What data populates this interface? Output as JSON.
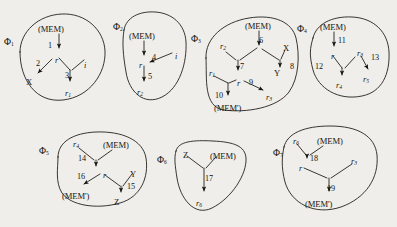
{
  "figure": {
    "background_color": "#efeeea",
    "ink_color": "#16150f"
  },
  "labels": {
    "mem": "(MEM)",
    "mem_prime": "(MEM')",
    "r": "r",
    "i": "i",
    "x": "X",
    "y": "Y",
    "z": "Z"
  },
  "fragments": [
    {
      "id": "phi1",
      "name": "Φ",
      "index": "1",
      "nodes": [
        {
          "key": "mem",
          "text": "(MEM)"
        },
        {
          "key": "r",
          "text": "r"
        },
        {
          "key": "i",
          "text": "i"
        },
        {
          "key": "x",
          "text": "X"
        },
        {
          "key": "r1",
          "text": "r",
          "sub": "1"
        }
      ],
      "edges": [
        {
          "label": "1",
          "from": "mem",
          "to": "r"
        },
        {
          "label": "2",
          "from": "r",
          "to": "x"
        },
        {
          "label": "3",
          "from": "r,i",
          "to": "r1"
        }
      ]
    },
    {
      "id": "phi2",
      "name": "Φ",
      "index": "2",
      "nodes": [
        {
          "key": "mem",
          "text": "(MEM)"
        },
        {
          "key": "r",
          "text": "r"
        },
        {
          "key": "i",
          "text": "i"
        },
        {
          "key": "r2",
          "text": "r",
          "sub": "2"
        }
      ],
      "edges": [
        {
          "label": "4",
          "from": "i",
          "to": "r"
        },
        {
          "label": "5",
          "from": "r",
          "to": "r2"
        }
      ]
    },
    {
      "id": "phi3",
      "name": "Φ",
      "index": "3",
      "nodes": [
        {
          "key": "mem",
          "text": "(MEM)"
        },
        {
          "key": "r2",
          "text": "r",
          "sub": "2"
        },
        {
          "key": "x",
          "text": "X"
        },
        {
          "key": "y",
          "text": "Y"
        },
        {
          "key": "r1",
          "text": "r",
          "sub": "1"
        },
        {
          "key": "r",
          "text": "r"
        },
        {
          "key": "r3",
          "text": "r",
          "sub": "3"
        },
        {
          "key": "memp",
          "text": "(MEM')"
        }
      ],
      "edges": [
        {
          "label": "6",
          "from": "mem",
          "to": "r"
        },
        {
          "label": "7",
          "from": "r2,mem",
          "to": "r"
        },
        {
          "label": "8",
          "from": "x",
          "to": "y"
        },
        {
          "label": "9",
          "from": "r",
          "to": "r3"
        },
        {
          "label": "10",
          "from": "r1,r",
          "to": "memp"
        }
      ]
    },
    {
      "id": "phi4",
      "name": "Φ",
      "index": "4",
      "nodes": [
        {
          "key": "mem",
          "text": "(MEM)"
        },
        {
          "key": "r",
          "text": "r"
        },
        {
          "key": "r3",
          "text": "r",
          "sub": "3"
        },
        {
          "key": "r4",
          "text": "r",
          "sub": "4"
        },
        {
          "key": "r5",
          "text": "r",
          "sub": "5"
        }
      ],
      "edges": [
        {
          "label": "11",
          "from": "mem",
          "to": "r"
        },
        {
          "label": "12",
          "from": "r",
          "to": "r4"
        },
        {
          "label": "13",
          "from": "r3",
          "to": "r5"
        }
      ]
    },
    {
      "id": "phi5",
      "name": "Φ",
      "index": "5",
      "nodes": [
        {
          "key": "r4",
          "text": "r",
          "sub": "4"
        },
        {
          "key": "mem",
          "text": "(MEM)"
        },
        {
          "key": "r",
          "text": "r"
        },
        {
          "key": "y",
          "text": "Y"
        },
        {
          "key": "memp",
          "text": "(MEM')"
        },
        {
          "key": "z",
          "text": "Z"
        }
      ],
      "edges": [
        {
          "label": "14",
          "from": "r4,mem",
          "to": "r"
        },
        {
          "label": "16",
          "from": "r",
          "to": "memp"
        },
        {
          "label": "15",
          "from": "r,y",
          "to": "z"
        }
      ]
    },
    {
      "id": "phi6",
      "name": "Φ",
      "index": "6",
      "nodes": [
        {
          "key": "z",
          "text": "Z"
        },
        {
          "key": "mem",
          "text": "(MEM)"
        },
        {
          "key": "r6",
          "text": "r",
          "sub": "6"
        }
      ],
      "edges": [
        {
          "label": "17",
          "from": "z,mem",
          "to": "r6"
        }
      ]
    },
    {
      "id": "phi7",
      "name": "Φ",
      "index": "7",
      "nodes": [
        {
          "key": "r6",
          "text": "r",
          "sub": "6"
        },
        {
          "key": "mem",
          "text": "(MEM)"
        },
        {
          "key": "r",
          "text": "r"
        },
        {
          "key": "r3",
          "text": "r",
          "sub": "3"
        },
        {
          "key": "memp",
          "text": "(MEM')"
        }
      ],
      "edges": [
        {
          "label": "18",
          "from": "r6,mem",
          "to": "r"
        },
        {
          "label": "19",
          "from": "r,r3",
          "to": "memp"
        }
      ]
    }
  ],
  "text_nodes": [
    {
      "id": "phi1-name",
      "kind": "phi",
      "main": "Φ",
      "sub": "1",
      "x": 4,
      "y": 37
    },
    {
      "id": "phi1-mem",
      "kind": "mem",
      "main": "(MEM)",
      "sub": "",
      "x": 38,
      "y": 25
    },
    {
      "id": "phi1-edge1",
      "kind": "num",
      "main": "1",
      "sub": "",
      "x": 48,
      "y": 42
    },
    {
      "id": "phi1-r",
      "kind": "var",
      "main": "r",
      "sub": "",
      "x": 55,
      "y": 57
    },
    {
      "id": "phi1-edge2",
      "kind": "num",
      "main": "2",
      "sub": "",
      "x": 36,
      "y": 60
    },
    {
      "id": "phi1-i",
      "kind": "var",
      "main": "i",
      "sub": "",
      "x": 84,
      "y": 62
    },
    {
      "id": "phi1-x",
      "kind": "cap",
      "main": "X",
      "sub": "",
      "x": 26,
      "y": 78
    },
    {
      "id": "phi1-edge3",
      "kind": "num",
      "main": "3",
      "sub": "",
      "x": 65,
      "y": 72
    },
    {
      "id": "phi1-r1",
      "kind": "var",
      "main": "r",
      "sub": "1",
      "x": 65,
      "y": 90
    },
    {
      "id": "phi2-name",
      "kind": "phi",
      "main": "Φ",
      "sub": "2",
      "x": 113,
      "y": 22
    },
    {
      "id": "phi2-mem",
      "kind": "mem",
      "main": "(MEM)",
      "sub": "",
      "x": 129,
      "y": 32
    },
    {
      "id": "phi2-r",
      "kind": "var",
      "main": "r",
      "sub": "",
      "x": 139,
      "y": 62
    },
    {
      "id": "phi2-edge4",
      "kind": "num",
      "main": "4",
      "sub": "",
      "x": 152,
      "y": 54
    },
    {
      "id": "phi2-i",
      "kind": "var",
      "main": "i",
      "sub": "",
      "x": 175,
      "y": 53
    },
    {
      "id": "phi2-edge5",
      "kind": "num",
      "main": "5",
      "sub": "",
      "x": 148,
      "y": 73
    },
    {
      "id": "phi2-r2",
      "kind": "var",
      "main": "r",
      "sub": "2",
      "x": 137,
      "y": 89
    },
    {
      "id": "phi3-name",
      "kind": "phi",
      "main": "Φ",
      "sub": "3",
      "x": 191,
      "y": 34
    },
    {
      "id": "phi3-mem",
      "kind": "mem",
      "main": "(MEM)",
      "sub": "",
      "x": 245,
      "y": 22
    },
    {
      "id": "phi3-edge6",
      "kind": "num",
      "main": "6",
      "sub": "",
      "x": 259,
      "y": 37
    },
    {
      "id": "phi3-r2",
      "kind": "var",
      "main": "r",
      "sub": "2",
      "x": 220,
      "y": 43
    },
    {
      "id": "phi3-x",
      "kind": "cap",
      "main": "X",
      "sub": "",
      "x": 283,
      "y": 44
    },
    {
      "id": "phi3-edge7",
      "kind": "num",
      "main": "7",
      "sub": "",
      "x": 240,
      "y": 63
    },
    {
      "id": "phi3-y",
      "kind": "cap",
      "main": "Y",
      "sub": "",
      "x": 274,
      "y": 69
    },
    {
      "id": "phi3-edge8",
      "kind": "num",
      "main": "8",
      "sub": "",
      "x": 290,
      "y": 63
    },
    {
      "id": "phi3-r1",
      "kind": "var",
      "main": "r",
      "sub": "1",
      "x": 209,
      "y": 70
    },
    {
      "id": "phi3-r",
      "kind": "var",
      "main": "r",
      "sub": "",
      "x": 237,
      "y": 80
    },
    {
      "id": "phi3-edge9",
      "kind": "num",
      "main": "9",
      "sub": "",
      "x": 249,
      "y": 79
    },
    {
      "id": "phi3-edge10",
      "kind": "num",
      "main": "10",
      "sub": "",
      "x": 215,
      "y": 92
    },
    {
      "id": "phi3-r3",
      "kind": "var",
      "main": "r",
      "sub": "3",
      "x": 266,
      "y": 94
    },
    {
      "id": "phi3-memp",
      "kind": "mem",
      "main": "(MEM')",
      "sub": "",
      "x": 214,
      "y": 104
    },
    {
      "id": "phi4-name",
      "kind": "phi",
      "main": "Φ",
      "sub": "4",
      "x": 297,
      "y": 24
    },
    {
      "id": "phi4-mem",
      "kind": "mem",
      "main": "(MEM)",
      "sub": "",
      "x": 320,
      "y": 23
    },
    {
      "id": "phi4-edge11",
      "kind": "num",
      "main": "11",
      "sub": "",
      "x": 338,
      "y": 37
    },
    {
      "id": "phi4-r",
      "kind": "var",
      "main": "r",
      "sub": "",
      "x": 331,
      "y": 53
    },
    {
      "id": "phi4-r3",
      "kind": "var",
      "main": "r",
      "sub": "3",
      "x": 357,
      "y": 50
    },
    {
      "id": "phi4-edge13",
      "kind": "num",
      "main": "13",
      "sub": "",
      "x": 371,
      "y": 54
    },
    {
      "id": "phi4-edge12",
      "kind": "num",
      "main": "12",
      "sub": "",
      "x": 315,
      "y": 63
    },
    {
      "id": "phi4-r4",
      "kind": "var",
      "main": "r",
      "sub": "4",
      "x": 336,
      "y": 82
    },
    {
      "id": "phi4-r5",
      "kind": "var",
      "main": "r",
      "sub": "5",
      "x": 363,
      "y": 76
    },
    {
      "id": "phi5-name",
      "kind": "phi",
      "main": "Φ",
      "sub": "5",
      "x": 39,
      "y": 146
    },
    {
      "id": "phi5-r4",
      "kind": "var",
      "main": "r",
      "sub": "4",
      "x": 73,
      "y": 141
    },
    {
      "id": "phi5-mem",
      "kind": "mem",
      "main": "(MEM)",
      "sub": "",
      "x": 103,
      "y": 141
    },
    {
      "id": "phi5-edge14",
      "kind": "num",
      "main": "14",
      "sub": "",
      "x": 78,
      "y": 155
    },
    {
      "id": "phi5-r",
      "kind": "var",
      "main": "r",
      "sub": "",
      "x": 103,
      "y": 172
    },
    {
      "id": "phi5-edge16",
      "kind": "num",
      "main": "16",
      "sub": "",
      "x": 77,
      "y": 173
    },
    {
      "id": "phi5-y",
      "kind": "cap",
      "main": "Y",
      "sub": "",
      "x": 130,
      "y": 170
    },
    {
      "id": "phi5-edge15",
      "kind": "num",
      "main": "15",
      "sub": "",
      "x": 127,
      "y": 183
    },
    {
      "id": "phi5-memp",
      "kind": "mem",
      "main": "(MEM')",
      "sub": "",
      "x": 62,
      "y": 192
    },
    {
      "id": "phi5-z",
      "kind": "cap",
      "main": "Z",
      "sub": "",
      "x": 114,
      "y": 198
    },
    {
      "id": "phi6-name",
      "kind": "phi",
      "main": "Φ",
      "sub": "6",
      "x": 157,
      "y": 155
    },
    {
      "id": "phi6-z",
      "kind": "cap",
      "main": "Z",
      "sub": "",
      "x": 183,
      "y": 151
    },
    {
      "id": "phi6-mem",
      "kind": "mem",
      "main": "(MEM)",
      "sub": "",
      "x": 210,
      "y": 152
    },
    {
      "id": "phi6-edge17",
      "kind": "num",
      "main": "17",
      "sub": "",
      "x": 205,
      "y": 175
    },
    {
      "id": "phi6-r6",
      "kind": "var",
      "main": "r",
      "sub": "6",
      "x": 196,
      "y": 200
    },
    {
      "id": "phi7-name",
      "kind": "phi",
      "main": "Φ",
      "sub": "7",
      "x": 273,
      "y": 148
    },
    {
      "id": "phi7-r6",
      "kind": "var",
      "main": "r",
      "sub": "6",
      "x": 293,
      "y": 138
    },
    {
      "id": "phi7-mem",
      "kind": "mem",
      "main": "(MEM)",
      "sub": "",
      "x": 317,
      "y": 137
    },
    {
      "id": "phi7-edge18",
      "kind": "num",
      "main": "18",
      "sub": "",
      "x": 310,
      "y": 155
    },
    {
      "id": "phi7-r",
      "kind": "var",
      "main": "r",
      "sub": "",
      "x": 299,
      "y": 165
    },
    {
      "id": "phi7-r3",
      "kind": "var",
      "main": "r",
      "sub": "3",
      "x": 351,
      "y": 158
    },
    {
      "id": "phi7-edge19",
      "kind": "num",
      "main": "19",
      "sub": "",
      "x": 327,
      "y": 185
    },
    {
      "id": "phi7-memp",
      "kind": "mem",
      "main": "(MEM')",
      "sub": "",
      "x": 305,
      "y": 200
    }
  ]
}
